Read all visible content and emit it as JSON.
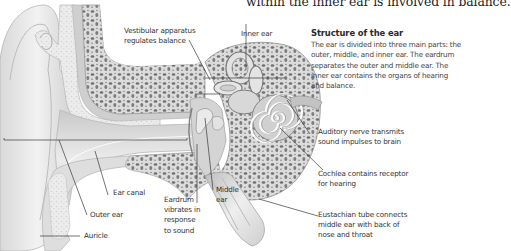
{
  "headline": "within the inner ear is involved in balance.",
  "info": {
    "title": "Structure of the ear",
    "body": "The ear is divided into three main parts: the outer, middle, and inner ear. The eardrum separates the outer and middle ear. The inner ear contains the organs of hearing and balance."
  },
  "labels": {
    "vestibular_1": "Vestibular apparatus",
    "vestibular_2": "regulates balance",
    "inner_ear": "Inner ear",
    "auditory_nerve_1": "Auditory nerve transmits",
    "auditory_nerve_2": "sound impulses to brain",
    "cochlea_1": "Cochlea contains receptor",
    "cochlea_2": "for hearing",
    "eustachian_1": "Eustachian tube connects",
    "eustachian_2": "middle ear with back of",
    "eustachian_3": "nose and throat",
    "ear_canal": "Ear canal",
    "outer_ear": "Outer ear",
    "auricle": "Auricle",
    "middle_ear_1": "Middle",
    "middle_ear_2": "ear",
    "eardrum_1": "Eardrum",
    "eardrum_2": "vibrates in",
    "eardrum_3": "response",
    "eardrum_4": "to sound"
  },
  "colors": {
    "background": "#ffffff",
    "text": "#333333",
    "leader_line": "#3a3a3a",
    "tissue_light": "#e6e6e6",
    "tissue_mid": "#c8c8c8",
    "bone_dark": "#6f6f6f"
  }
}
